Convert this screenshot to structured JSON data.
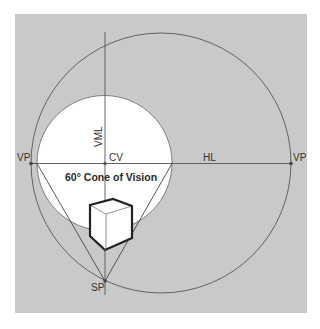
{
  "diagram": {
    "title": "60° Cone of Vision",
    "labels": {
      "vp_left": "VP",
      "vp_right": "VP",
      "cv": "CV",
      "hl": "HL",
      "vml": "VML",
      "sp": "SP",
      "cone": "60° Cone of Vision"
    },
    "colors": {
      "background": "#c9c9c9",
      "cone_fill": "#ffffff",
      "line": "#555555",
      "cube_stroke": "#222222"
    },
    "elements": [
      "horizon-line",
      "vertical-measuring-line",
      "station-point-circle",
      "cone-of-vision-circle",
      "cone-of-vision-triangle",
      "cube"
    ]
  }
}
